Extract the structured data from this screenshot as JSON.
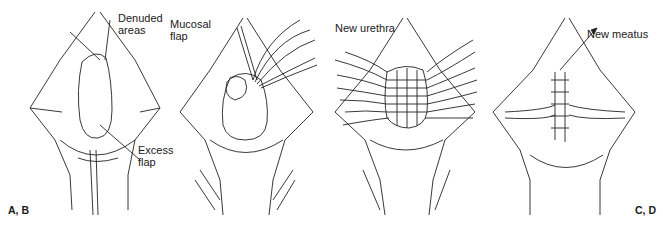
{
  "figure": {
    "type": "surgical-illustration",
    "panels": [
      {
        "id": "A",
        "labels": {
          "denuded": "Denuded\nareas",
          "denuded_line1": "Denuded",
          "denuded_line2": "areas",
          "excess_line1": "Excess",
          "excess_line2": "flap"
        }
      },
      {
        "id": "B",
        "labels": {
          "mucosal_line1": "Mucosal",
          "mucosal_line2": "flap"
        }
      },
      {
        "id": "C",
        "labels": {
          "new_urethra": "New urethra"
        }
      },
      {
        "id": "D",
        "labels": {
          "new_meatus": "New meatus"
        }
      }
    ],
    "letters": {
      "left": "A, B",
      "right": "C, D"
    }
  },
  "colors": {
    "ink": "#1a1a1a",
    "background": "#ffffff"
  }
}
